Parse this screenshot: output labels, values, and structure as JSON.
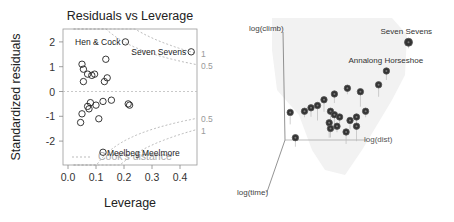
{
  "chart_data": [
    {
      "type": "scatter",
      "title": "Residuals vs Leverage",
      "xlabel": "Leverage",
      "ylabel": "Standardized residuals",
      "xlim": [
        -0.02,
        0.46
      ],
      "ylim": [
        -2.95,
        2.55
      ],
      "xticks": [
        0.0,
        0.1,
        0.2,
        0.3,
        0.4
      ],
      "xtick_labels": [
        "0.0",
        "0.1",
        "0.2",
        "0.3",
        "0.4"
      ],
      "yticks": [
        2,
        1,
        0,
        -1,
        -2
      ],
      "ytick_labels": [
        "2",
        "1",
        "0",
        "-1",
        "-2"
      ],
      "grid": false,
      "points": [
        {
          "x": 0.05,
          "y": 1.1
        },
        {
          "x": 0.055,
          "y": 0.9
        },
        {
          "x": 0.07,
          "y": 0.7
        },
        {
          "x": 0.085,
          "y": 0.65
        },
        {
          "x": 0.095,
          "y": 0.7
        },
        {
          "x": 0.055,
          "y": 0.4
        },
        {
          "x": 0.135,
          "y": 1.3
        },
        {
          "x": 0.14,
          "y": 0.55
        },
        {
          "x": 0.13,
          "y": 0.4
        },
        {
          "x": 0.07,
          "y": -0.6
        },
        {
          "x": 0.08,
          "y": -0.45
        },
        {
          "x": 0.075,
          "y": -0.7
        },
        {
          "x": 0.1,
          "y": -0.55
        },
        {
          "x": 0.125,
          "y": -0.4
        },
        {
          "x": 0.155,
          "y": -0.35
        },
        {
          "x": 0.215,
          "y": -0.5
        },
        {
          "x": 0.22,
          "y": -0.55
        },
        {
          "x": 0.05,
          "y": -0.9
        },
        {
          "x": 0.045,
          "y": -1.25
        },
        {
          "x": 0.11,
          "y": -1.1
        },
        {
          "x": 0.205,
          "y": 2.0,
          "label": "Hen & Cock"
        },
        {
          "x": 0.44,
          "y": 1.6,
          "label": "Seven Sevens"
        },
        {
          "x": 0.125,
          "y": -2.45,
          "label": "Meelbeg Meelmore"
        }
      ],
      "cooks_distance": {
        "legend": "Cook's distance",
        "levels": [
          "1",
          "0.5"
        ]
      }
    },
    {
      "type": "scatter",
      "subtype": "3d",
      "axes": {
        "x": "log(dist)",
        "y": "log(climb)",
        "z": "log(time)"
      },
      "annotations": [
        "Seven Sevens",
        "Annalong Horseshoe"
      ],
      "points_screen_relative": "projected 3d scatter, 23 points",
      "points": [
        {
          "label": "Seven Sevens",
          "dist": 0.95,
          "climb": 0.85
        },
        {
          "label": "Annalong Horseshoe",
          "dist": 0.78,
          "climb": 0.6
        },
        {
          "dist": 0.72,
          "climb": 0.48
        },
        {
          "dist": 0.58,
          "climb": 0.42
        },
        {
          "dist": 0.48,
          "climb": 0.45
        },
        {
          "dist": 0.38,
          "climb": 0.4
        },
        {
          "dist": 0.3,
          "climb": 0.35
        },
        {
          "dist": 0.25,
          "climb": 0.3
        },
        {
          "dist": 0.15,
          "climb": 0.25
        },
        {
          "dist": 0.2,
          "climb": 0.28
        },
        {
          "dist": 0.35,
          "climb": 0.25
        },
        {
          "dist": 0.38,
          "climb": 0.22
        },
        {
          "dist": 0.42,
          "climb": 0.2
        },
        {
          "dist": 0.5,
          "climb": 0.17
        },
        {
          "dist": 0.55,
          "climb": 0.2
        },
        {
          "dist": 0.34,
          "climb": 0.15
        },
        {
          "dist": 0.4,
          "climb": 0.12
        },
        {
          "dist": 0.35,
          "climb": 0.1
        },
        {
          "dist": 0.47,
          "climb": 0.07
        },
        {
          "dist": 0.55,
          "climb": 0.12
        },
        {
          "dist": 0.62,
          "climb": 0.25
        },
        {
          "dist": 0.08,
          "climb": 0.02
        },
        {
          "dist": 0.04,
          "climb": 0.24
        }
      ]
    }
  ]
}
